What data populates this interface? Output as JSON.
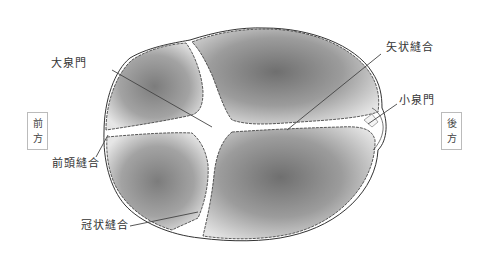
{
  "diagram": {
    "labels": {
      "anterior_fontanelle": "大泉門",
      "sagittal_suture": "矢状縫合",
      "posterior_fontanelle": "小泉門",
      "frontal_suture": "前頭縫合",
      "coronal_suture": "冠状縫合"
    },
    "directions": {
      "front": [
        "前",
        "方"
      ],
      "back": [
        "後",
        "方"
      ]
    },
    "colors": {
      "bone": "#9a9a9a",
      "bone_dark": "#6e6e6e",
      "fontanelle": "#ffffff",
      "outline": "#333333",
      "leader_line": "#444444"
    }
  }
}
